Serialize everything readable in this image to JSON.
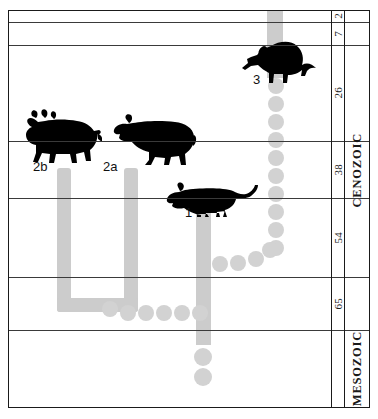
{
  "figure": {
    "title": "",
    "type": "stratigraphic-range-chart",
    "colors": {
      "lineage_bar": "#cccccc",
      "dot": "#d2d2d2",
      "silhouette": "#000000",
      "rule": "#3a3a3a",
      "frame": "#1a1a1a"
    }
  },
  "time_scale": {
    "unit": "Ma",
    "boundaries": [
      2,
      7,
      26,
      38,
      54,
      65
    ],
    "cells": [
      {
        "label": "2",
        "top": 10,
        "bottom": 22
      },
      {
        "label": "7",
        "top": 22,
        "bottom": 45
      },
      {
        "label": "26",
        "top": 45,
        "bottom": 141
      },
      {
        "label": "38",
        "top": 141,
        "bottom": 198
      },
      {
        "label": "54",
        "top": 198,
        "bottom": 277
      },
      {
        "label": "65",
        "top": 277,
        "bottom": 330
      }
    ]
  },
  "eras": [
    {
      "label": "CENOZOIC",
      "top": 10,
      "bottom": 330
    },
    {
      "label": "MESOZOIC",
      "top": 330,
      "bottom": 408
    }
  ],
  "rules": [
    22,
    45,
    141,
    198,
    277,
    330
  ],
  "taxa": [
    {
      "id": "2b",
      "label": "2b",
      "label_x": 33,
      "label_y": 159,
      "silhouette": "brontothere"
    },
    {
      "id": "2a",
      "label": "2a",
      "label_x": 103,
      "label_y": 159,
      "silhouette": "creodont"
    },
    {
      "id": "1",
      "label": "1",
      "label_x": 185,
      "label_y": 205,
      "silhouette": "carnivoran"
    },
    {
      "id": "3",
      "label": "3",
      "label_x": 253,
      "label_y": 72,
      "silhouette": "aardvark"
    }
  ],
  "lineage_bars": [
    {
      "name": "aardvark-range",
      "x": 267,
      "y": 10,
      "w": 16,
      "h": 68,
      "rounded": false
    },
    {
      "name": "taxon-2b-range",
      "x": 57,
      "y": 168,
      "w": 14,
      "h": 144,
      "rounded": true
    },
    {
      "name": "taxon-2a-range",
      "x": 124,
      "y": 168,
      "w": 14,
      "h": 144,
      "rounded": true
    },
    {
      "name": "u-connector",
      "x": 57,
      "y": 298,
      "w": 81,
      "h": 14,
      "rounded": true
    },
    {
      "name": "taxon-1-range",
      "x": 196,
      "y": 205,
      "w": 15,
      "h": 140,
      "rounded": false
    }
  ],
  "dot_chains": [
    {
      "name": "aardvark-ghost-lineage",
      "orientation": "vertical",
      "dots": [
        {
          "cx": 276,
          "cy": 86,
          "r": 8
        },
        {
          "cx": 276,
          "cy": 104,
          "r": 8
        },
        {
          "cx": 276,
          "cy": 122,
          "r": 8
        },
        {
          "cx": 276,
          "cy": 140,
          "r": 8
        },
        {
          "cx": 276,
          "cy": 158,
          "r": 8
        },
        {
          "cx": 276,
          "cy": 176,
          "r": 8
        },
        {
          "cx": 276,
          "cy": 194,
          "r": 8
        },
        {
          "cx": 276,
          "cy": 212,
          "r": 8
        },
        {
          "cx": 276,
          "cy": 230,
          "r": 8
        },
        {
          "cx": 276,
          "cy": 248,
          "r": 8
        }
      ]
    },
    {
      "name": "diagonal-ghost-lineage",
      "orientation": "diagonal",
      "dots": [
        {
          "cx": 220,
          "cy": 264,
          "r": 8
        },
        {
          "cx": 238,
          "cy": 263,
          "r": 8
        },
        {
          "cx": 256,
          "cy": 259,
          "r": 8
        },
        {
          "cx": 270,
          "cy": 250,
          "r": 8
        }
      ]
    },
    {
      "name": "basal-ghost-lineage",
      "orientation": "horizontal",
      "dots": [
        {
          "cx": 110,
          "cy": 309,
          "r": 8
        },
        {
          "cx": 128,
          "cy": 313,
          "r": 8
        },
        {
          "cx": 146,
          "cy": 313,
          "r": 8
        },
        {
          "cx": 164,
          "cy": 313,
          "r": 8
        },
        {
          "cx": 182,
          "cy": 313,
          "r": 8
        },
        {
          "cx": 200,
          "cy": 313,
          "r": 8
        }
      ]
    },
    {
      "name": "taxon-1-root-ghost",
      "orientation": "vertical",
      "dots": [
        {
          "cx": 203,
          "cy": 357,
          "r": 9
        },
        {
          "cx": 203,
          "cy": 377,
          "r": 9
        }
      ]
    }
  ]
}
